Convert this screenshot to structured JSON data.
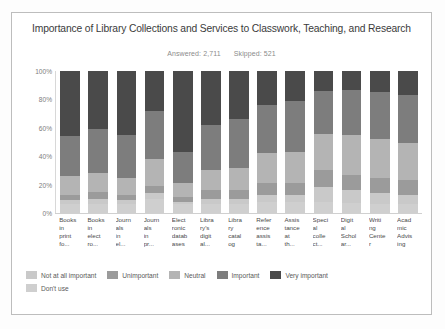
{
  "card": {
    "title": "Importance of Library Collections and Services to Classwork, Teaching, and Research",
    "answered_label": "Answered: 2,711",
    "skipped_label": "Skipped: 521"
  },
  "chart_data": {
    "type": "bar",
    "subtype": "100-percent-stacked-column",
    "title": "Importance of Library Collections and Services to Classwork, Teaching, and Research",
    "subtitle": "Answered: 2,711   Skipped: 521",
    "xlabel": "",
    "ylabel": "",
    "ylim": [
      0,
      100
    ],
    "ytick_labels": [
      "100%",
      "80%",
      "60%",
      "40%",
      "20%",
      "0%"
    ],
    "ytick_values": [
      100,
      80,
      60,
      40,
      20,
      0
    ],
    "grid": false,
    "legend_position": "bottom",
    "categories": [
      "Books in print fo...",
      "Books in elect ro...",
      "Journ als in el...",
      "Journ als in pr...",
      "Elect ronic datab ases",
      "Libra ry's digit al...",
      "Libra ry catal og",
      "Refer ence assis ta...",
      "Assis tance at th...",
      "Speci al colle ct...",
      "Digit al Schol ar...",
      "Writi ng Cente r",
      "Acad mic Advis ing"
    ],
    "series": [
      {
        "name": "Not at all important",
        "color": "#c9c9c9",
        "values": [
          3,
          4,
          3,
          4,
          2,
          4,
          4,
          5,
          5,
          10,
          9,
          8,
          7
        ]
      },
      {
        "name": "Unimportant",
        "color": "#9b9b9b",
        "values": [
          4,
          5,
          4,
          5,
          3,
          6,
          6,
          8,
          8,
          12,
          11,
          11,
          10
        ]
      },
      {
        "name": "Neutral",
        "color": "#b4b4b4",
        "values": [
          13,
          13,
          12,
          19,
          10,
          14,
          16,
          21,
          22,
          26,
          28,
          27,
          26
        ]
      },
      {
        "name": "Important",
        "color": "#7d7d7d",
        "values": [
          28,
          31,
          30,
          34,
          22,
          32,
          34,
          34,
          36,
          30,
          32,
          33,
          34
        ]
      },
      {
        "name": "Very important",
        "color": "#4a4a4a",
        "values": [
          46,
          41,
          45,
          28,
          57,
          38,
          34,
          24,
          21,
          14,
          13,
          15,
          17
        ]
      },
      {
        "name": "Don't use",
        "color": "#cfcfcf",
        "values": [
          6,
          6,
          6,
          10,
          6,
          6,
          6,
          8,
          8,
          8,
          7,
          6,
          6
        ]
      }
    ]
  },
  "legend": {
    "items": [
      {
        "label": "Not at all important",
        "color": "#c9c9c9"
      },
      {
        "label": "Unimportant",
        "color": "#9b9b9b"
      },
      {
        "label": "Neutral",
        "color": "#b4b4b4"
      },
      {
        "label": "Important",
        "color": "#7d7d7d"
      },
      {
        "label": "Very important",
        "color": "#4a4a4a"
      },
      {
        "label": "Don't use",
        "color": "#cfcfcf"
      }
    ]
  }
}
